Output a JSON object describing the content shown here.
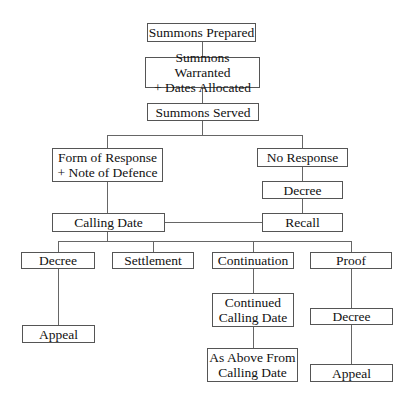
{
  "diagram": {
    "type": "flowchart",
    "nodes": {
      "summons_prepared": "Summons Prepared",
      "summons_warranted": "Summons Warranted\n+ Dates Allocated",
      "summons_served": "Summons Served",
      "form_of_response": "Form of Response\n+ Note of Defence",
      "no_response": "No Response",
      "decree_after_no_response": "Decree",
      "calling_date": "Calling Date",
      "recall": "Recall",
      "decree_after_calling": "Decree",
      "settlement": "Settlement",
      "continuation": "Continuation",
      "proof": "Proof",
      "appeal_after_decree": "Appeal",
      "continued_calling_date": "Continued\nCalling Date",
      "decree_after_proof": "Decree",
      "as_above": "As Above From\nCalling Date",
      "appeal_after_proof": "Appeal"
    },
    "edges": [
      [
        "summons_prepared",
        "summons_warranted"
      ],
      [
        "summons_warranted",
        "summons_served"
      ],
      [
        "summons_served",
        "form_of_response"
      ],
      [
        "summons_served",
        "no_response"
      ],
      [
        "no_response",
        "decree_after_no_response"
      ],
      [
        "decree_after_no_response",
        "recall"
      ],
      [
        "form_of_response",
        "calling_date"
      ],
      [
        "recall",
        "calling_date"
      ],
      [
        "calling_date",
        "decree_after_calling"
      ],
      [
        "calling_date",
        "settlement"
      ],
      [
        "calling_date",
        "continuation"
      ],
      [
        "calling_date",
        "proof"
      ],
      [
        "decree_after_calling",
        "appeal_after_decree"
      ],
      [
        "continuation",
        "continued_calling_date"
      ],
      [
        "continued_calling_date",
        "as_above"
      ],
      [
        "proof",
        "decree_after_proof"
      ],
      [
        "decree_after_proof",
        "appeal_after_proof"
      ]
    ]
  }
}
